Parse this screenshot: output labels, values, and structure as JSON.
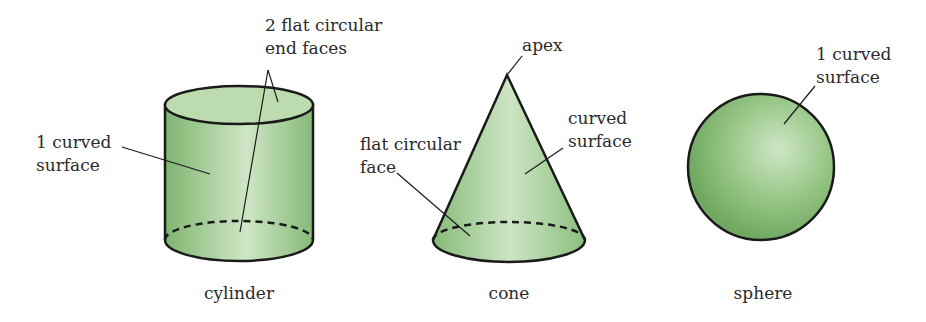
{
  "figure": {
    "title": "",
    "colors": {
      "fill_light": "#cfe6c6",
      "fill_mid": "#9cc98c",
      "fill_dark": "#6ea75e",
      "outline": "#1a1a1a",
      "text": "#2a2a2a",
      "background": "#ffffff"
    },
    "shapes": [
      {
        "name": "cylinder",
        "caption": "cylinder",
        "labels": [
          {
            "id": "curved",
            "line1": "1 curved",
            "line2": "surface"
          },
          {
            "id": "ends",
            "line1": "2 flat circular",
            "line2": "end faces"
          }
        ]
      },
      {
        "name": "cone",
        "caption": "cone",
        "labels": [
          {
            "id": "apex",
            "line1": "apex"
          },
          {
            "id": "curved",
            "line1": "curved",
            "line2": "surface"
          },
          {
            "id": "base",
            "line1": "flat circular",
            "line2": "face"
          }
        ]
      },
      {
        "name": "sphere",
        "caption": "sphere",
        "labels": [
          {
            "id": "curved",
            "line1": "1 curved",
            "line2": "surface"
          }
        ]
      }
    ]
  }
}
